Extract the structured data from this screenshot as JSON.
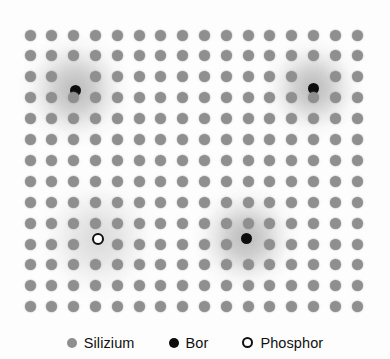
{
  "figure": {
    "background_color": "#fdfdfd"
  },
  "lattice": {
    "columns": 16,
    "rows": 14,
    "origin_x": 30,
    "origin_y": 35,
    "spacing_x": 21.8,
    "spacing_y": 20.9,
    "atom_color": "#8f8f8f",
    "atom_label": "Silizium"
  },
  "dopants": [
    {
      "type": "bor",
      "label": "Bor",
      "col": 2,
      "row": 2,
      "x": 75,
      "y": 90,
      "color": "#0d0d0d",
      "halo": "dark",
      "halo_size": 116
    },
    {
      "type": "bor",
      "label": "Bor",
      "col": 13,
      "row": 2,
      "x": 313,
      "y": 88,
      "color": "#0d0d0d",
      "halo": "dark",
      "halo_size": 104
    },
    {
      "type": "phosphor",
      "label": "Phosphor",
      "col": 3,
      "row": 10,
      "x": 98,
      "y": 239,
      "color": "#ffffff",
      "halo": "light",
      "halo_size": 128
    },
    {
      "type": "bor",
      "label": "Bor",
      "col": 10,
      "row": 10,
      "x": 246,
      "y": 238,
      "color": "#0d0d0d",
      "halo": "dark",
      "halo_size": 110
    }
  ],
  "legend": {
    "items": [
      {
        "label": "Silizium",
        "marker": "filled-gray-dot",
        "color": "#8f8f8f"
      },
      {
        "label": "Bor",
        "marker": "filled-black-dot",
        "color": "#0d0d0d"
      },
      {
        "label": "Phosphor",
        "marker": "open-circle",
        "color": "#ffffff"
      }
    ]
  },
  "chart_data": {
    "type": "scatter",
    "xlabel": "",
    "ylabel": "",
    "grid": false,
    "legend_position": "bottom",
    "series": [
      {
        "name": "Silizium",
        "marker": "filled circle",
        "color": "#8f8f8f",
        "description": "16 x 14 regular square lattice of gray atoms, minus the 4 lattice sites occupied by dopant atoms",
        "count": 220
      },
      {
        "name": "Bor",
        "marker": "filled black circle",
        "color": "#0d0d0d",
        "description": "Acceptor dopant atoms, each surrounded by a dark diffuse halo (hole cloud)",
        "count": 3,
        "points": [
          {
            "col": 2,
            "row": 2
          },
          {
            "col": 13,
            "row": 2
          },
          {
            "col": 10,
            "row": 10
          }
        ]
      },
      {
        "name": "Phosphor",
        "marker": "open circle",
        "color": "#ffffff",
        "description": "Donor dopant atom, surrounded by a lighter diffuse halo (electron cloud)",
        "count": 1,
        "points": [
          {
            "col": 3,
            "row": 10
          }
        ]
      }
    ]
  }
}
